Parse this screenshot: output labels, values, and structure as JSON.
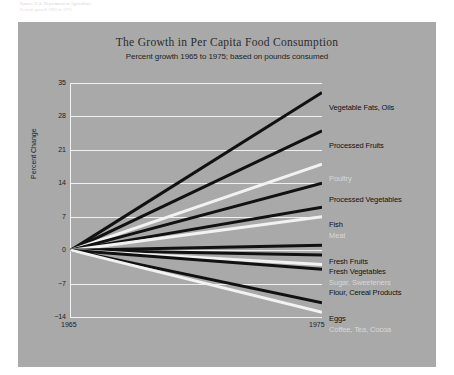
{
  "source_note": {
    "line1": "Source: U.S. Department of Agriculture",
    "line2": "Percent growth 1965 to 1975"
  },
  "chart_data": {
    "type": "line",
    "title": "The Growth in Per Capita Food Consumption",
    "subtitle": "Percent growth 1965 to 1975; based on pounds consumed",
    "xlabel": "",
    "ylabel": "Percent Change",
    "x": [
      1965,
      1975
    ],
    "xticklabels": [
      "1965",
      "1975"
    ],
    "ylim": [
      -14,
      35
    ],
    "yticks": [
      35,
      28,
      21,
      14,
      7,
      0,
      -7,
      -14
    ],
    "yticklabels": [
      "35",
      "28",
      "21",
      "14",
      "7",
      "0",
      "−7",
      "−14"
    ],
    "grid": true,
    "legend": "right-inline-labels",
    "background": "#a9a9a9",
    "series": [
      {
        "name": "Vegetable Fats, Oils",
        "values": [
          0,
          33
        ],
        "color": "#111111",
        "label_color": "dark",
        "label_y": 86
      },
      {
        "name": "Processed Fruits",
        "values": [
          0,
          25
        ],
        "color": "#111111",
        "label_color": "dark",
        "label_y": 124
      },
      {
        "name": "Poultry",
        "values": [
          0,
          18
        ],
        "color": "#f2f2f2",
        "label_color": "light",
        "label_y": 157
      },
      {
        "name": "Processed Vegetables",
        "values": [
          0,
          14
        ],
        "color": "#111111",
        "label_color": "dark",
        "label_y": 178
      },
      {
        "name": "Fish",
        "values": [
          0,
          9
        ],
        "color": "#111111",
        "label_color": "dark",
        "label_y": 203
      },
      {
        "name": "Meat",
        "values": [
          0,
          7
        ],
        "color": "#f2f2f2",
        "label_color": "light",
        "label_y": 214
      },
      {
        "name": "Fresh Fruits",
        "values": [
          0,
          1
        ],
        "color": "#111111",
        "label_color": "dark",
        "label_y": 240
      },
      {
        "name": "Fresh Vegetables",
        "values": [
          0,
          -1
        ],
        "color": "#111111",
        "label_color": "dark",
        "label_y": 250
      },
      {
        "name": "Sugar, Sweeteners",
        "values": [
          0,
          -3
        ],
        "color": "#f2f2f2",
        "label_color": "light",
        "label_y": 261
      },
      {
        "name": "Flour, Cereal Products",
        "values": [
          0,
          -4
        ],
        "color": "#111111",
        "label_color": "dark",
        "label_y": 271
      },
      {
        "name": "Eggs",
        "values": [
          0,
          -11
        ],
        "color": "#111111",
        "label_color": "dark",
        "label_y": 297
      },
      {
        "name": "Coffee, Tea, Cocoa",
        "values": [
          0,
          -13
        ],
        "color": "#f2f2f2",
        "label_color": "light",
        "label_y": 308
      }
    ]
  }
}
